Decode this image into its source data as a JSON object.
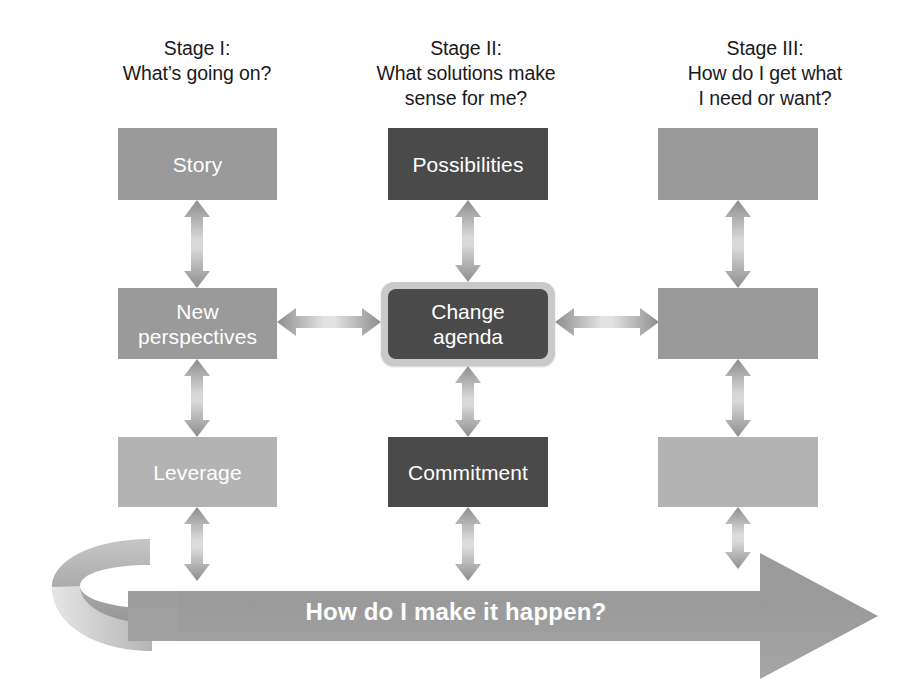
{
  "diagram": {
    "banner_label": "How do I make it happen?",
    "stages": [
      {
        "name": "Stage I:",
        "question": "What’s going on?"
      },
      {
        "name": "Stage II:",
        "question_line1": "What solutions make",
        "question_line2": "sense for me?"
      },
      {
        "name": "Stage III:",
        "question_line1": "How do I get what",
        "question_line2": "I need or want?"
      }
    ],
    "boxes": {
      "row1": [
        {
          "label": "Story",
          "tone": "mid"
        },
        {
          "label": "Possibilities",
          "tone": "dark"
        },
        {
          "label": "",
          "tone": "mid"
        }
      ],
      "row2": [
        {
          "label_line1": "New",
          "label_line2": "perspectives",
          "tone": "mid"
        },
        {
          "label_line1": "Change",
          "label_line2": "agenda",
          "tone": "dark-framed"
        },
        {
          "label": "",
          "tone": "mid"
        }
      ],
      "row3": [
        {
          "label": "Leverage",
          "tone": "light"
        },
        {
          "label": "Commitment",
          "tone": "dark"
        },
        {
          "label": "",
          "tone": "light"
        }
      ]
    },
    "colors": {
      "mid_gray": "#9a9a9a",
      "dark_gray": "#4a4a4a",
      "light_gray": "#b3b3b3",
      "frame_gray": "#c9c9c9",
      "arrow_gray": "#8f8f8f",
      "banner_gray": "#9a9a9a",
      "text_dark": "#1a1a1a",
      "text_light": "#ffffff"
    }
  }
}
